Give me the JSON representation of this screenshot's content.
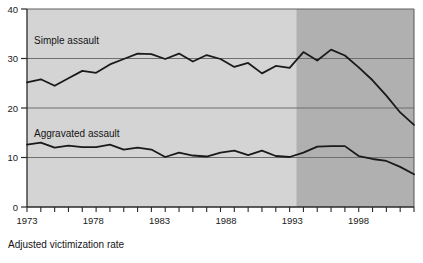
{
  "chart_data": {
    "type": "line",
    "title": "",
    "subtitle": "",
    "xlabel": "Adjusted victimization rate",
    "ylabel": "",
    "xlim": [
      1973,
      2001
    ],
    "ylim": [
      0,
      40
    ],
    "yticks": [
      0,
      10,
      20,
      30,
      40
    ],
    "ytick_labels": [
      "0",
      "10",
      "20",
      "30",
      "40"
    ],
    "xticks": [
      1973,
      1974,
      1975,
      1976,
      1977,
      1978,
      1979,
      1980,
      1981,
      1982,
      1983,
      1984,
      1985,
      1986,
      1987,
      1988,
      1989,
      1990,
      1991,
      1992,
      1993,
      1994,
      1995,
      1996,
      1997,
      1998,
      1999,
      2000,
      2001
    ],
    "xtick_labels_shown": [
      "1973",
      "1978",
      "1983",
      "1988",
      "1993",
      "1998"
    ],
    "xtick_labels_shown_years": [
      1973,
      1978,
      1983,
      1988,
      1993,
      1998
    ],
    "grid": true,
    "grid_axis": "y",
    "legend": "inline-annotation",
    "x": [
      1973,
      1974,
      1975,
      1976,
      1977,
      1978,
      1979,
      1980,
      1981,
      1982,
      1983,
      1984,
      1985,
      1986,
      1987,
      1988,
      1989,
      1990,
      1991,
      1992,
      1993,
      1994,
      1995,
      1996,
      1997,
      1998,
      1999,
      2000,
      2001
    ],
    "series": [
      {
        "name": "Simple assault",
        "label": "Simple assault",
        "color": "#1a1a1a",
        "values": [
          25.2,
          25.8,
          24.5,
          26.0,
          27.5,
          27.1,
          28.8,
          29.9,
          31.0,
          30.9,
          29.9,
          31.0,
          29.4,
          30.7,
          29.9,
          28.3,
          29.1,
          27.0,
          28.5,
          28.1,
          31.3,
          29.6,
          31.8,
          30.6,
          28.2,
          25.6,
          22.5,
          19.1,
          16.6
        ]
      },
      {
        "name": "Aggravated assault",
        "label": "Aggravated assault",
        "color": "#1a1a1a",
        "values": [
          12.6,
          13.0,
          12.0,
          12.4,
          12.1,
          12.1,
          12.6,
          11.6,
          12.0,
          11.6,
          10.1,
          11.0,
          10.4,
          10.2,
          11.0,
          11.4,
          10.5,
          11.4,
          10.3,
          10.1,
          11.0,
          12.2,
          12.3,
          12.3,
          10.3,
          9.7,
          9.3,
          8.1,
          6.6
        ]
      }
    ],
    "shaded_region": {
      "from": 1992.5,
      "to": 2001,
      "color": "#b0b0b0",
      "note": "redesigned survey period"
    },
    "plot_background": "#d4d4d4"
  },
  "labels": {
    "simple_assault": "Simple assault",
    "aggravated_assault": "Aggravated assault",
    "x_caption": "Adjusted victimization rate",
    "y_40": "40",
    "y_30": "30",
    "y_20": "20",
    "y_10": "10",
    "y_0": "0",
    "x_1973": "1973",
    "x_1978": "1978",
    "x_1983": "1983",
    "x_1988": "1988",
    "x_1993": "1993",
    "x_1998": "1998"
  },
  "colors": {
    "plot_bg_light": "#d4d4d4",
    "plot_bg_dark": "#b0b0b0",
    "line": "#1a1a1a",
    "grid": "#6f6f6f",
    "axis": "#2a2a2a",
    "text": "#151515"
  }
}
